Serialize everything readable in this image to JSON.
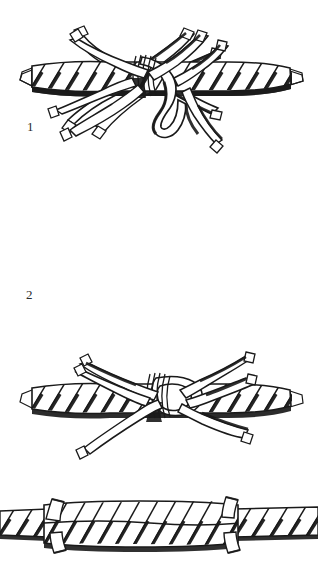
{
  "figure": {
    "background_color": "#ffffff",
    "ink_color": "#1a1a1a",
    "panel_count": 4,
    "style": "pen-and-ink line engraving"
  },
  "steps": [
    {
      "number": "1",
      "name": "marry-strands",
      "caption": "",
      "rope": {
        "axis_y": 78,
        "x_start": 30,
        "x_end": 292,
        "thickness": 26,
        "strand_count": 3,
        "lay": "right-hand"
      },
      "loose_strands": [
        {
          "name": "upper-left-strand",
          "tip_x": 80,
          "tip_y": 34
        },
        {
          "name": "upper-mid-strand",
          "tip_x": 178,
          "tip_y": 32
        },
        {
          "name": "upper-right-strand",
          "tip_x": 216,
          "tip_y": 52
        },
        {
          "name": "lower-left-strand",
          "tip_x": 98,
          "tip_y": 128
        },
        {
          "name": "lower-mid-strand",
          "tip_x": 130,
          "tip_y": 120
        },
        {
          "name": "lower-right-strand",
          "tip_x": 206,
          "tip_y": 112
        }
      ]
    },
    {
      "number": "2",
      "name": "first-tuck",
      "caption": "",
      "rope": {
        "axis_y": 240,
        "x_start": 30,
        "x_end": 292,
        "thickness": 26,
        "strand_count": 3,
        "lay": "right-hand"
      },
      "seizing": {
        "name": "whipping-turns",
        "x": 140,
        "turns": 5
      },
      "loose_strands": [
        {
          "name": "upper-left-strand",
          "tip_x": 74,
          "tip_y": 196
        },
        {
          "name": "upper-right-strand",
          "tip_x": 200,
          "tip_y": 192
        },
        {
          "name": "upper-far-right-strand",
          "tip_x": 220,
          "tip_y": 203
        },
        {
          "name": "lower-left-strand",
          "tip_x": 62,
          "tip_y": 275
        },
        {
          "name": "lower-mid-strand",
          "tip_x": 76,
          "tip_y": 296
        },
        {
          "name": "tucked-loop-strand",
          "tip_x": 222,
          "tip_y": 297
        }
      ]
    },
    {
      "number": "3",
      "name": "second-tuck",
      "caption": "",
      "rope": {
        "axis_y": 400,
        "x_start": 30,
        "x_end": 292,
        "thickness": 24,
        "strand_count": 3,
        "lay": "right-hand"
      },
      "seizing": {
        "name": "whipping-turns",
        "x": 155,
        "turns": 5
      },
      "loose_strands": [
        {
          "name": "upper-left-strand",
          "tip_x": 88,
          "tip_y": 364
        },
        {
          "name": "upper-right-strand",
          "tip_x": 246,
          "tip_y": 358
        },
        {
          "name": "upper-far-right-strand",
          "tip_x": 246,
          "tip_y": 378
        },
        {
          "name": "lower-left-strand",
          "tip_x": 94,
          "tip_y": 456
        },
        {
          "name": "lower-right-strand",
          "tip_x": 248,
          "tip_y": 428
        }
      ]
    },
    {
      "number": "",
      "name": "finished-splice",
      "caption": "",
      "rope": {
        "axis_y": 530,
        "x_start": 0,
        "x_end": 318,
        "thickness": 30,
        "strand_count": 3,
        "lay": "right-hand"
      },
      "trimmed_ends": [
        {
          "name": "trimmed-end-upper-left",
          "x": 52,
          "y": 512
        },
        {
          "name": "trimmed-end-lower-left",
          "x": 58,
          "y": 548
        },
        {
          "name": "trimmed-end-upper-right",
          "x": 224,
          "y": 513
        },
        {
          "name": "trimmed-end-lower-right",
          "x": 228,
          "y": 549
        }
      ]
    }
  ]
}
